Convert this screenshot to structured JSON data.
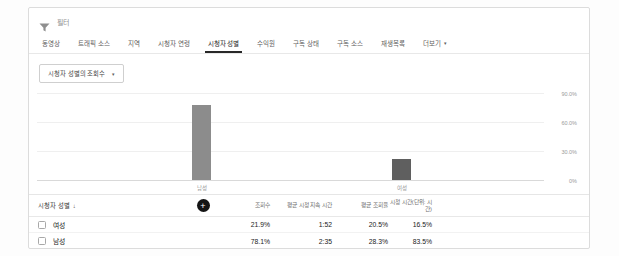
{
  "filter": {
    "label": "필터"
  },
  "tabs": {
    "items": [
      {
        "label": "동영상"
      },
      {
        "label": "트래픽 소스"
      },
      {
        "label": "지역"
      },
      {
        "label": "시청자 연령"
      },
      {
        "label": "시청자 성별"
      },
      {
        "label": "수익원"
      },
      {
        "label": "구독 상태"
      },
      {
        "label": "구독 소스"
      },
      {
        "label": "재생목록"
      },
      {
        "label": "더보기"
      }
    ],
    "active_index": 4,
    "more_caret": "▾"
  },
  "metric_picker": {
    "label": "시청자 성별의 조회수",
    "caret": "▾"
  },
  "chart_data": {
    "type": "bar",
    "title": "시청자 성별의 조회수",
    "categories": [
      "남성",
      "여성"
    ],
    "values": [
      78.1,
      21.9
    ],
    "unit": "%",
    "ylim": [
      0,
      93
    ],
    "ytick_values": [
      0,
      30,
      60,
      90
    ],
    "yticks": [
      "0%",
      "30.0%",
      "60.0%",
      "90.0%"
    ],
    "grid": true,
    "legend": "none",
    "bar_colors": [
      "#8c8c8c",
      "#5f5f5f"
    ],
    "px_per_percent": 0.9667
  },
  "table": {
    "columns": [
      "시청자 성별",
      "조회수",
      "평균 시청 지속 시간",
      "평균 조회율",
      "시청 시간(단위: 시간)"
    ],
    "sort_arrow": "↓",
    "add_metric_label": "+",
    "rows": [
      {
        "label": "여성",
        "views": "21.9%",
        "avg_duration": "1:52",
        "avg_pct": "20.5%",
        "watch_time": "16.5%"
      },
      {
        "label": "남성",
        "views": "78.1%",
        "avg_duration": "2:35",
        "avg_pct": "28.3%",
        "watch_time": "83.5%"
      }
    ]
  }
}
